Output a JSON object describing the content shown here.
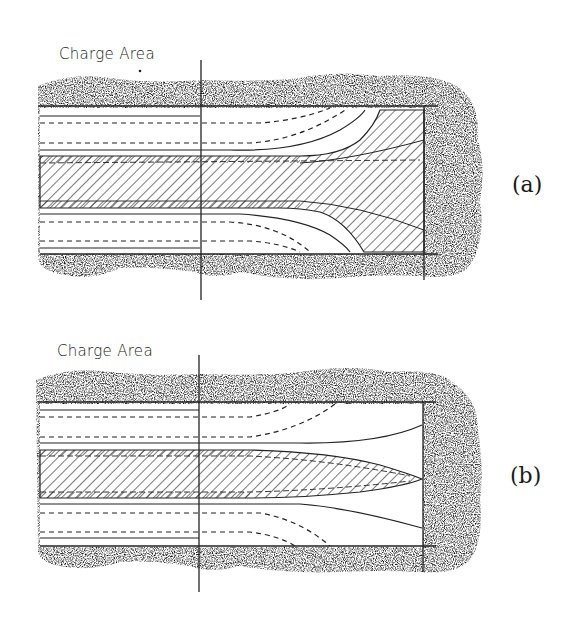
{
  "figure": {
    "panels": [
      {
        "id": "a",
        "label": "Charge Area",
        "tag": "(a)"
      },
      {
        "id": "b",
        "label": "Charge Area",
        "tag": "(b)"
      }
    ]
  },
  "colors": {
    "ink": "#222222",
    "stipple": "#555555",
    "background": "#ffffff"
  }
}
